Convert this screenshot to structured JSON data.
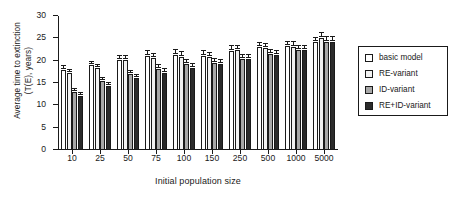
{
  "chart_data": {
    "type": "bar",
    "title": "",
    "xlabel": "Initial population size",
    "ylabel": "Average time to extinction\n(T(E), years)",
    "ylim": [
      0,
      30
    ],
    "yticks": [
      0,
      5,
      10,
      15,
      20,
      25,
      30
    ],
    "grid": false,
    "legend_position": "right",
    "categories": [
      "10",
      "25",
      "50",
      "75",
      "100",
      "150",
      "250",
      "500",
      "1000",
      "5000"
    ],
    "series": [
      {
        "name": "basic model",
        "color": "#ffffff",
        "values": [
          18.0,
          19.0,
          20.2,
          21.1,
          21.2,
          21.1,
          22.2,
          23.1,
          23.2,
          24.1
        ],
        "errors": [
          0.9,
          0.8,
          0.9,
          1.1,
          1.1,
          1.0,
          1.1,
          0.9,
          0.9,
          1.0
        ]
      },
      {
        "name": "RE-variant",
        "color": "#f2f2f2",
        "values": [
          17.2,
          18.3,
          20.2,
          20.6,
          20.8,
          20.8,
          22.3,
          22.8,
          23.1,
          25.0
        ],
        "errors": [
          0.8,
          0.8,
          0.9,
          1.0,
          1.1,
          1.0,
          1.1,
          1.0,
          1.0,
          1.1
        ]
      },
      {
        "name": "ID-variant",
        "color": "#a8a8a8",
        "values": [
          13.0,
          15.5,
          17.1,
          18.2,
          19.3,
          19.4,
          20.3,
          21.4,
          22.3,
          24.2
        ],
        "errors": [
          0.7,
          0.7,
          0.7,
          0.8,
          0.9,
          1.0,
          1.0,
          1.0,
          1.0,
          1.1
        ]
      },
      {
        "name": "RE+ID-variant",
        "color": "#2b2b2b",
        "values": [
          12.2,
          14.3,
          16.2,
          17.3,
          18.3,
          19.3,
          20.3,
          21.2,
          22.4,
          24.2
        ],
        "errors": [
          0.6,
          0.7,
          0.7,
          0.8,
          0.9,
          0.9,
          1.0,
          1.0,
          1.0,
          1.1
        ]
      }
    ]
  },
  "legend": {
    "items": [
      {
        "label": "basic model"
      },
      {
        "label": "RE-variant"
      },
      {
        "label": "ID-variant"
      },
      {
        "label": "RE+ID-variant"
      }
    ]
  }
}
